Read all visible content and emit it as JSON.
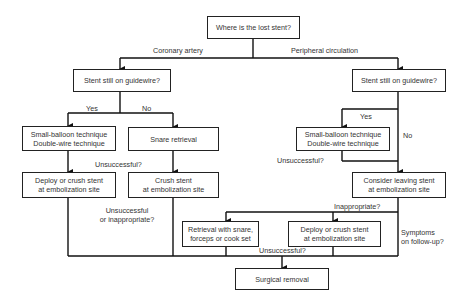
{
  "nodes": {
    "root": {
      "lines": [
        "Where is the lost stent?"
      ]
    },
    "coronary_guidewire": {
      "lines": [
        "Stent still on guidewire?"
      ]
    },
    "coronary_small_balloon": {
      "lines": [
        "Small-balloon technique",
        "Double-wire technique"
      ]
    },
    "coronary_snare": {
      "lines": [
        "Snare retrieval"
      ]
    },
    "coronary_deploy": {
      "lines": [
        "Deploy or crush stent",
        "at embolization site"
      ]
    },
    "coronary_crush": {
      "lines": [
        "Crush stent",
        "at embolization site"
      ]
    },
    "peripheral_guidewire": {
      "lines": [
        "Stent still on guidewire?"
      ]
    },
    "peripheral_small_balloon": {
      "lines": [
        "Small-balloon technique",
        "Double-wire technique"
      ]
    },
    "peripheral_consider": {
      "lines": [
        "Consider leaving stent",
        "at embolization site"
      ]
    },
    "peripheral_retrieval": {
      "lines": [
        "Retrieval with snare,",
        "forceps or cook set"
      ]
    },
    "peripheral_deploy": {
      "lines": [
        "Deploy or crush stent",
        "at embolization site"
      ]
    },
    "surgical": {
      "lines": [
        "Surgical removal"
      ]
    }
  },
  "edge_labels": {
    "coronary": "Coronary artery",
    "peripheral": "Peripheral circulation",
    "coronary_yes": "Yes",
    "coronary_no": "No",
    "coronary_unsuccessful": "Unsuccessful?",
    "coronary_unsuccessful_inappropriate": [
      "Unsuccessful",
      "or inappropriate?"
    ],
    "peripheral_yes": "Yes",
    "peripheral_no": "No",
    "peripheral_unsuccessful": "Unsuccessful?",
    "peripheral_inappropriate": "Inappropriate?",
    "peripheral_symptoms": [
      "Symptoms",
      "on follow-up?"
    ],
    "bottom_unsuccessful": "Unsuccessful?"
  }
}
